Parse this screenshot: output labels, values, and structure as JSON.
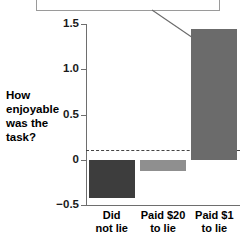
{
  "callout": {
    "text": "How pleasant was the task that was done?",
    "leader_icon": "leader-line"
  },
  "chart_data": {
    "type": "bar",
    "title": "",
    "subtitle": "",
    "xlabel": "",
    "ylabel": "How enjoyable was the task?",
    "categories": [
      "Did not lie",
      "Paid $20 to lie",
      "Paid $1 to lie"
    ],
    "category_lines": [
      [
        "Did",
        "not lie"
      ],
      [
        "Paid $20",
        "to lie"
      ],
      [
        "Paid $1",
        "to lie"
      ]
    ],
    "values": [
      -0.42,
      -0.12,
      1.45
    ],
    "bar_colors": [
      "#3d3d3d",
      "#8f8f8f",
      "#6b6b6b"
    ],
    "ylim": [
      -0.5,
      1.5
    ],
    "yticks": [
      1.5,
      1.0,
      0.5,
      0,
      -0.5
    ],
    "ytick_labels": [
      "1.5",
      "1.0",
      "0.5",
      "0",
      "−0.5"
    ],
    "grid": false,
    "zero_line": true,
    "legend": "none"
  },
  "axis": {
    "y_title_line1": "How",
    "y_title_line2": "enjoyable",
    "y_title_line3": "was the",
    "y_title_line4": "task?"
  }
}
